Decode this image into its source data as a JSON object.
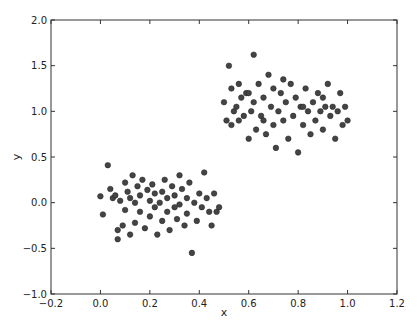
{
  "chart_data": {
    "type": "scatter",
    "title": "",
    "xlabel": "x",
    "ylabel": "y",
    "xlim": [
      -0.2,
      1.2
    ],
    "ylim": [
      -1.0,
      2.0
    ],
    "xticks": [
      "-0.2",
      "0.0",
      "0.2",
      "0.4",
      "0.6",
      "0.8",
      "1.0",
      "1.2"
    ],
    "yticks": [
      "-1.0",
      "-0.5",
      "0.0",
      "0.5",
      "1.0",
      "1.5",
      "2.0"
    ],
    "grid": false,
    "legend": null,
    "marker_color": "#444444",
    "series": [
      {
        "name": "cluster-1",
        "points": [
          [
            0.0,
            0.07
          ],
          [
            0.01,
            -0.13
          ],
          [
            0.03,
            0.41
          ],
          [
            0.04,
            0.15
          ],
          [
            0.05,
            0.05
          ],
          [
            0.06,
            0.08
          ],
          [
            0.07,
            -0.3
          ],
          [
            0.07,
            -0.4
          ],
          [
            0.08,
            0.02
          ],
          [
            0.09,
            -0.25
          ],
          [
            0.1,
            0.22
          ],
          [
            0.1,
            -0.08
          ],
          [
            0.11,
            0.12
          ],
          [
            0.12,
            0.05
          ],
          [
            0.12,
            -0.35
          ],
          [
            0.13,
            0.3
          ],
          [
            0.14,
            0.0
          ],
          [
            0.14,
            -0.22
          ],
          [
            0.15,
            0.18
          ],
          [
            0.16,
            -0.1
          ],
          [
            0.16,
            0.08
          ],
          [
            0.17,
            0.25
          ],
          [
            0.18,
            -0.28
          ],
          [
            0.19,
            0.14
          ],
          [
            0.2,
            0.02
          ],
          [
            0.2,
            -0.15
          ],
          [
            0.21,
            0.2
          ],
          [
            0.22,
            -0.05
          ],
          [
            0.22,
            0.1
          ],
          [
            0.23,
            -0.35
          ],
          [
            0.24,
            0.0
          ],
          [
            0.25,
            0.12
          ],
          [
            0.25,
            -0.2
          ],
          [
            0.26,
            0.25
          ],
          [
            0.27,
            -0.1
          ],
          [
            0.27,
            0.05
          ],
          [
            0.28,
            -0.3
          ],
          [
            0.29,
            0.18
          ],
          [
            0.3,
            -0.05
          ],
          [
            0.3,
            0.08
          ],
          [
            0.31,
            -0.18
          ],
          [
            0.32,
            0.3
          ],
          [
            0.32,
            -0.02
          ],
          [
            0.33,
            0.15
          ],
          [
            0.34,
            -0.25
          ],
          [
            0.35,
            0.05
          ],
          [
            0.35,
            -0.12
          ],
          [
            0.36,
            0.22
          ],
          [
            0.37,
            -0.55
          ],
          [
            0.38,
            0.0
          ],
          [
            0.39,
            -0.2
          ],
          [
            0.4,
            0.1
          ],
          [
            0.41,
            -0.05
          ],
          [
            0.42,
            0.33
          ],
          [
            0.43,
            0.05
          ],
          [
            0.44,
            -0.1
          ],
          [
            0.45,
            -0.25
          ],
          [
            0.46,
            0.1
          ],
          [
            0.47,
            -0.1
          ],
          [
            0.48,
            -0.05
          ]
        ]
      },
      {
        "name": "cluster-2",
        "points": [
          [
            0.5,
            1.1
          ],
          [
            0.51,
            0.9
          ],
          [
            0.52,
            1.5
          ],
          [
            0.53,
            1.25
          ],
          [
            0.53,
            0.85
          ],
          [
            0.55,
            1.05
          ],
          [
            0.56,
            1.3
          ],
          [
            0.56,
            0.9
          ],
          [
            0.57,
            1.15
          ],
          [
            0.58,
            0.95
          ],
          [
            0.59,
            1.2
          ],
          [
            0.6,
            0.7
          ],
          [
            0.61,
            1.0
          ],
          [
            0.62,
            1.62
          ],
          [
            0.62,
            1.1
          ],
          [
            0.63,
            0.8
          ],
          [
            0.64,
            1.3
          ],
          [
            0.65,
            0.95
          ],
          [
            0.66,
            1.15
          ],
          [
            0.67,
            0.75
          ],
          [
            0.68,
            1.4
          ],
          [
            0.69,
            1.05
          ],
          [
            0.7,
            0.85
          ],
          [
            0.7,
            1.25
          ],
          [
            0.71,
            0.6
          ],
          [
            0.72,
            1.0
          ],
          [
            0.73,
            1.2
          ],
          [
            0.74,
            0.9
          ],
          [
            0.75,
            1.1
          ],
          [
            0.76,
            0.7
          ],
          [
            0.77,
            1.3
          ],
          [
            0.78,
            0.95
          ],
          [
            0.79,
            1.15
          ],
          [
            0.8,
            0.55
          ],
          [
            0.81,
            1.05
          ],
          [
            0.82,
            0.85
          ],
          [
            0.83,
            1.25
          ],
          [
            0.84,
            1.0
          ],
          [
            0.85,
            0.75
          ],
          [
            0.86,
            1.1
          ],
          [
            0.87,
            0.9
          ],
          [
            0.88,
            1.2
          ],
          [
            0.89,
            1.0
          ],
          [
            0.9,
            0.8
          ],
          [
            0.91,
            1.05
          ],
          [
            0.92,
            1.3
          ],
          [
            0.93,
            0.95
          ],
          [
            0.94,
            1.05
          ],
          [
            0.95,
            0.7
          ],
          [
            0.96,
            1.0
          ],
          [
            0.97,
            1.2
          ],
          [
            0.98,
            0.85
          ],
          [
            0.99,
            1.05
          ],
          [
            1.0,
            0.9
          ],
          [
            0.54,
            1.0
          ],
          [
            0.6,
            1.2
          ],
          [
            0.66,
            0.9
          ],
          [
            0.74,
            1.35
          ],
          [
            0.82,
            1.05
          ],
          [
            0.9,
            1.15
          ]
        ]
      }
    ]
  }
}
